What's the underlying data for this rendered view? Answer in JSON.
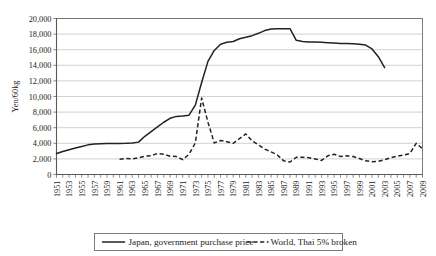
{
  "chart_data": {
    "type": "line",
    "title": "",
    "xlabel": "",
    "ylabel": "Yen/60kg",
    "ylim": [
      0,
      20000
    ],
    "ytick_step": 2000,
    "ytick_labels": [
      "0",
      "2,000",
      "4,000",
      "6,000",
      "8,000",
      "10,000",
      "12,000",
      "14,000",
      "16,000",
      "18,000",
      "20,000"
    ],
    "xlim": [
      1951,
      2009
    ],
    "xtick_labels": [
      "1951",
      "1953",
      "1955",
      "1957",
      "1959",
      "1961",
      "1963",
      "1965",
      "1967",
      "1969",
      "1971",
      "1973",
      "1975",
      "1977",
      "1979",
      "1981",
      "1983",
      "1985",
      "1987",
      "1989",
      "1991",
      "1993",
      "1995",
      "1997",
      "1999",
      "2001",
      "2003",
      "2005",
      "2007",
      "2009"
    ],
    "xtick_every_year": true,
    "grid": "horizontal",
    "legend_position": "below",
    "x": [
      1951,
      1952,
      1953,
      1954,
      1955,
      1956,
      1957,
      1958,
      1959,
      1960,
      1961,
      1962,
      1963,
      1964,
      1965,
      1966,
      1967,
      1968,
      1969,
      1970,
      1971,
      1972,
      1973,
      1974,
      1975,
      1976,
      1977,
      1978,
      1979,
      1980,
      1981,
      1982,
      1983,
      1984,
      1985,
      1986,
      1987,
      1988,
      1989,
      1990,
      1991,
      1992,
      1993,
      1994,
      1995,
      1996,
      1997,
      1998,
      1999,
      2000,
      2001,
      2002,
      2003,
      2004,
      2005,
      2006,
      2007,
      2008,
      2009
    ],
    "series": [
      {
        "name": "Japan, government purchase price",
        "style": "solid",
        "color": "#222222",
        "x_start": 1951,
        "x_end": 2003,
        "values": [
          2700,
          2950,
          3180,
          3400,
          3600,
          3800,
          3900,
          3950,
          3960,
          3970,
          3980,
          4000,
          4050,
          4150,
          4900,
          5500,
          6100,
          6700,
          7200,
          7450,
          7500,
          7600,
          8900,
          11800,
          14500,
          15900,
          16700,
          16950,
          17050,
          17400,
          17600,
          17800,
          18100,
          18450,
          18650,
          18700,
          18700,
          18700,
          17200,
          17050,
          17000,
          17000,
          16950,
          16900,
          16850,
          16800,
          16800,
          16750,
          16700,
          16600,
          16100,
          15100,
          13700,
          null,
          null,
          null,
          null,
          null,
          null
        ]
      },
      {
        "name": "World, Thai 5% broken",
        "style": "dashed",
        "color": "#222222",
        "x_start": 1961,
        "x_end": 2009,
        "values": [
          null,
          null,
          null,
          null,
          null,
          null,
          null,
          null,
          null,
          null,
          1950,
          2050,
          2000,
          2150,
          2350,
          2400,
          2700,
          2600,
          2350,
          2300,
          1900,
          2600,
          4050,
          9800,
          6700,
          4050,
          4350,
          4200,
          4000,
          4600,
          5200,
          4300,
          3800,
          3250,
          2900,
          2500,
          1750,
          1600,
          2200,
          2200,
          2150,
          2000,
          1800,
          2400,
          2600,
          2300,
          2400,
          2300,
          2050,
          1750,
          1650,
          1700,
          1900,
          2150,
          2350,
          2500,
          2700,
          4000,
          3300
        ]
      }
    ]
  },
  "legend": {
    "items": [
      {
        "label": "Japan, government purchase price",
        "style": "solid"
      },
      {
        "label": "World, Thai 5% broken",
        "style": "dashed"
      }
    ]
  },
  "axes": {
    "y_axis_title": "Yen/60kg"
  }
}
